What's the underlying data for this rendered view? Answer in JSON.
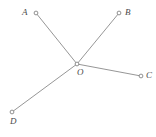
{
  "figure": {
    "canvas": {
      "width": 156,
      "height": 137
    },
    "background_color": "#ffffff",
    "line_color": "#8a8a8a",
    "marker_fill_color": "#ffffff",
    "marker_stroke_color": "#7d7d7d",
    "label_color": "#4a4a4a",
    "vertex": {
      "id": "O",
      "label": "O",
      "x": 77,
      "y": 64,
      "label_x": 77,
      "label_y": 68
    },
    "endpoints": [
      {
        "id": "A",
        "label": "A",
        "x": 36,
        "y": 13,
        "label_x": 22,
        "label_y": 8
      },
      {
        "id": "B",
        "label": "B",
        "x": 119,
        "y": 13,
        "label_x": 125,
        "label_y": 8
      },
      {
        "id": "C",
        "label": "C",
        "x": 141,
        "y": 76,
        "label_x": 146,
        "label_y": 71
      },
      {
        "id": "D",
        "label": "D",
        "x": 12,
        "y": 112,
        "label_x": 10,
        "label_y": 117
      }
    ],
    "segments": [
      {
        "id": "OA",
        "label": "OA",
        "from": "O",
        "to": "A",
        "x1": 77,
        "y1": 64,
        "x2": 36,
        "y2": 13
      },
      {
        "id": "OB",
        "label": "OB",
        "from": "O",
        "to": "B",
        "x1": 77,
        "y1": 64,
        "x2": 119,
        "y2": 13
      },
      {
        "id": "OC",
        "label": "OC",
        "from": "O",
        "to": "C",
        "x1": 77,
        "y1": 64,
        "x2": 141,
        "y2": 76
      },
      {
        "id": "OD",
        "label": "OD",
        "from": "O",
        "to": "D",
        "x1": 77,
        "y1": 64,
        "x2": 12,
        "y2": 112
      }
    ],
    "marker_radius": 1.9
  }
}
